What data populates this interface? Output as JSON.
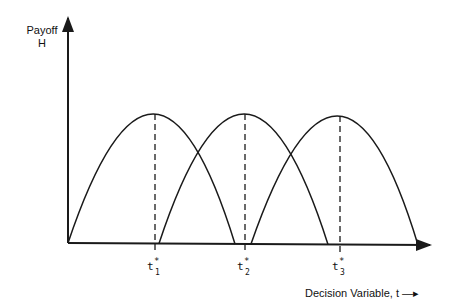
{
  "diagram": {
    "y_axis_label_line1": "Payoff",
    "y_axis_label_line2": "H",
    "x_axis_label": "Decision Variable, t —▸",
    "stroke_color": "#1a1a1a",
    "ticks": [
      {
        "label": "t",
        "sup": "*",
        "sub": "1",
        "x": 155
      },
      {
        "label": "t",
        "sup": "*",
        "sub": "2",
        "x": 245
      },
      {
        "label": "t",
        "sup": "*",
        "sub": "3",
        "x": 340
      }
    ],
    "curves": [
      {
        "start_x": 68,
        "peak_x": 155,
        "end_x": 235,
        "peak_y": 114
      },
      {
        "start_x": 159,
        "peak_x": 245,
        "end_x": 328,
        "peak_y": 114
      },
      {
        "start_x": 251,
        "peak_x": 340,
        "end_x": 418,
        "peak_y": 116
      }
    ]
  }
}
